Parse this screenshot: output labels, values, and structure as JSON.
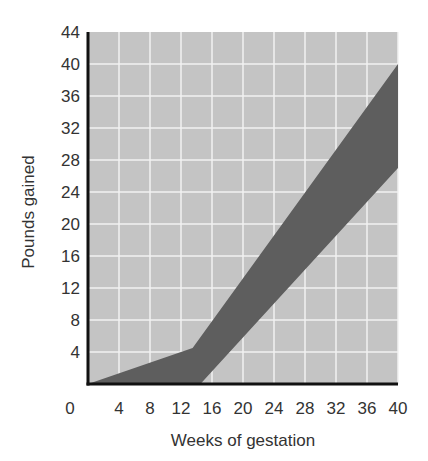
{
  "chart_data": {
    "type": "area",
    "title": "",
    "xlabel": "Weeks of gestation",
    "ylabel": "Pounds gained",
    "xlim": [
      0,
      40
    ],
    "ylim": [
      0,
      44
    ],
    "x_ticks": [
      0,
      4,
      8,
      12,
      16,
      20,
      24,
      28,
      32,
      36,
      40
    ],
    "y_ticks": [
      4,
      8,
      12,
      16,
      20,
      24,
      28,
      32,
      36,
      40,
      44
    ],
    "y_zero_label": "0",
    "grid": true,
    "legend": null,
    "series": [
      {
        "name": "Upper bound",
        "points": [
          [
            0,
            0
          ],
          [
            13.5,
            4.5
          ],
          [
            40,
            40
          ]
        ]
      },
      {
        "name": "Lower bound",
        "points": [
          [
            0,
            0
          ],
          [
            14.5,
            0
          ],
          [
            40,
            27
          ]
        ]
      }
    ],
    "fill_between": [
      "Upper bound",
      "Lower bound"
    ],
    "colors": {
      "plot_background": "#c4c4c4",
      "band": "#5e5e5e",
      "grid": "#f2f2f2",
      "axis": "#111111",
      "text": "#333333"
    }
  }
}
